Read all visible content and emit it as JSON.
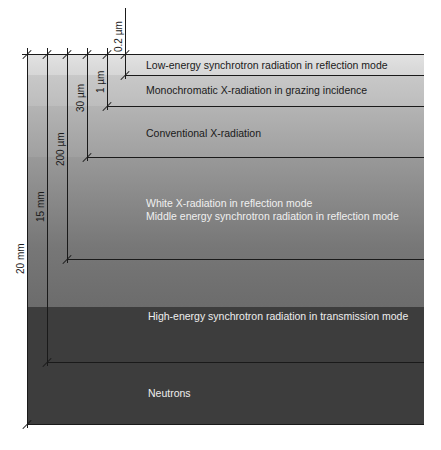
{
  "layers": [
    {
      "label": "Low-energy synchrotron radiation in reflection mode",
      "color": "#dcdcdc",
      "text_color": "#1a1a1a"
    },
    {
      "label": "Monochromatic X-radiation in grazing incidence",
      "color": "#c2c2c2",
      "text_color": "#1a1a1a"
    },
    {
      "label": "Conventional X-radiation",
      "color": "#a8a8a8",
      "text_color": "#1a1a1a"
    },
    {
      "label_lines": [
        "White X-radiation in reflection mode",
        "Middle energy synchrotron radiation in reflection mode"
      ],
      "color": "#7e7e7e",
      "text_color": "#f0f0f0"
    },
    {
      "label": "High-energy synchrotron radiation in transmission mode",
      "color": "#3c3c3c",
      "text_color": "#eeeeee"
    },
    {
      "label": "Neutrons",
      "color": "#3c3c3c",
      "text_color": "#eeeeee"
    }
  ],
  "dimensions": {
    "d0_2um": "0.2 µm",
    "d1um": "1 µm",
    "d30um": "30 µm",
    "d200um": "200 µm",
    "d15mm": "15 mm",
    "d20mm": "20 mm"
  }
}
